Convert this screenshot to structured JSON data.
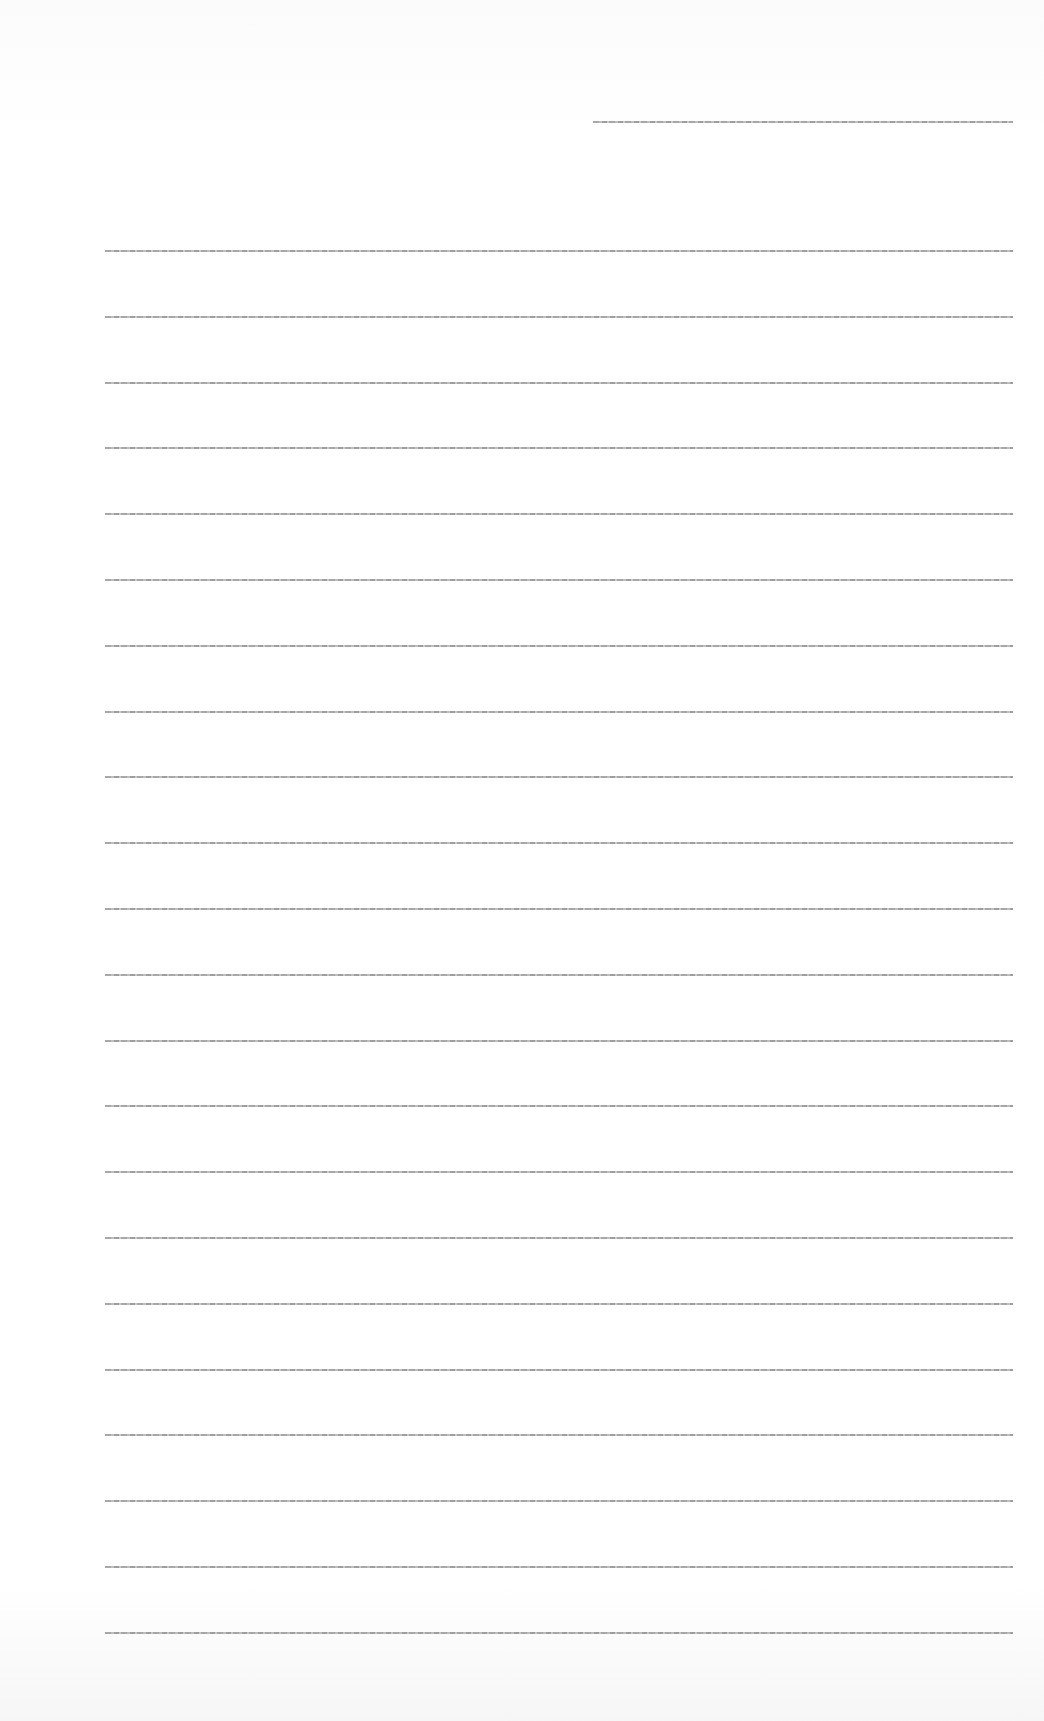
{
  "page": {
    "type": "blank ruled sheet",
    "header_line": {
      "top": 121,
      "left": 593,
      "width": 420
    },
    "rules": {
      "count": 22,
      "first_top": 250,
      "spacing": 65.8,
      "left": 105,
      "width": 908
    },
    "colors": {
      "paper": "#ffffff",
      "line": "#8a8a8a"
    }
  }
}
